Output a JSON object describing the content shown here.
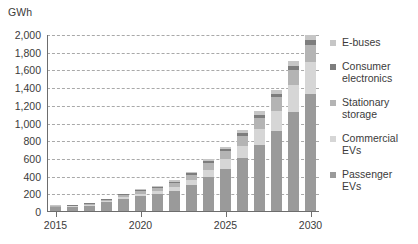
{
  "chart_data": {
    "type": "bar",
    "stacked": true,
    "title": "",
    "subtitle": "",
    "xlabel": "",
    "ylabel": "GWh",
    "unit": "GWh",
    "ylim": [
      0,
      2000
    ],
    "ystep": 200,
    "grid": true,
    "legend_position": "right",
    "categories": [
      "2015",
      "2016",
      "2017",
      "2018",
      "2019",
      "2020",
      "2021",
      "2022",
      "2023",
      "2024",
      "2025",
      "2026",
      "2027",
      "2028",
      "2029",
      "2030"
    ],
    "x_tick_labels": [
      "2015",
      "2020",
      "2025",
      "2030"
    ],
    "y_tick_labels": [
      "0",
      "200",
      "400",
      "600",
      "800",
      "1,000",
      "1,200",
      "1,400",
      "1,600",
      "1,800",
      "2,000"
    ],
    "y_tick_values": [
      0,
      200,
      400,
      600,
      800,
      1000,
      1200,
      1400,
      1600,
      1800,
      2000
    ],
    "series": [
      {
        "name": "Passenger EVs",
        "color": "#9a9a9a",
        "values": [
          55,
          58,
          72,
          110,
          150,
          180,
          200,
          235,
          300,
          395,
          490,
          610,
          755,
          915,
          1130,
          1330
        ]
      },
      {
        "name": "Commercial EVs",
        "color": "#d6d6d6",
        "values": [
          4,
          5,
          8,
          12,
          18,
          25,
          32,
          45,
          60,
          80,
          105,
          140,
          180,
          230,
          300,
          360
        ]
      },
      {
        "name": "Stationary storage",
        "color": "#b4b4b4",
        "values": [
          6,
          8,
          10,
          14,
          20,
          28,
          35,
          45,
          60,
          75,
          90,
          110,
          130,
          155,
          180,
          200
        ]
      },
      {
        "name": "Consumer electronics",
        "color": "#7d7d7d",
        "values": [
          8,
          9,
          10,
          11,
          12,
          14,
          16,
          18,
          20,
          23,
          26,
          30,
          34,
          38,
          44,
          50
        ]
      },
      {
        "name": "E-buses",
        "color": "#c6c6c6",
        "values": [
          2,
          3,
          4,
          6,
          8,
          10,
          12,
          15,
          18,
          22,
          26,
          32,
          38,
          45,
          55,
          60
        ]
      }
    ],
    "totals": [
      75,
      83,
      104,
      153,
      208,
      257,
      295,
      358,
      458,
      595,
      737,
      922,
      1137,
      1383,
      1709,
      2000
    ]
  },
  "legend": {
    "items": [
      {
        "label": "E-buses",
        "color": "#c6c6c6"
      },
      {
        "label": "Consumer\nelectronics",
        "color": "#7d7d7d"
      },
      {
        "label": "Stationary\nstorage",
        "color": "#b4b4b4"
      },
      {
        "label": "Commercial\nEVs",
        "color": "#d6d6d6"
      },
      {
        "label": "Passenger\nEVs",
        "color": "#9a9a9a"
      }
    ]
  },
  "colors": {
    "background": "#ffffff",
    "axis": "#6d6d6d",
    "grid": "#9b9b9b",
    "text": "#3b3b3b"
  }
}
